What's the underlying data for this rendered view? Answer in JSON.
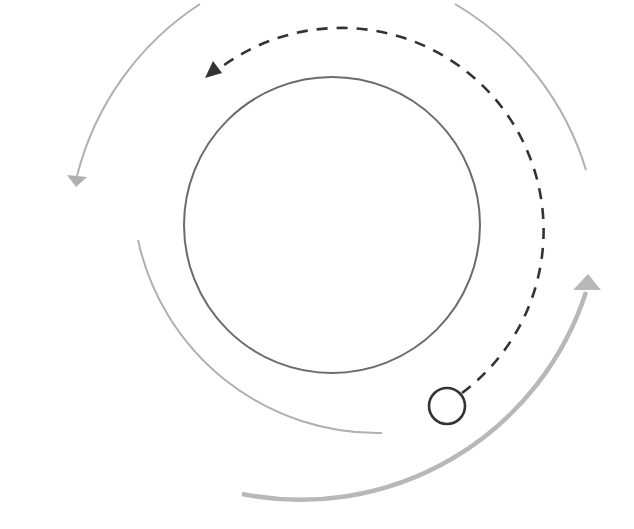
{
  "diagram": {
    "type": "cycle-arcs",
    "canvas": {
      "width": 634,
      "height": 529,
      "background": "#ffffff"
    },
    "colors": {
      "inner_circle": "#6b6b6b",
      "dashed_path": "#333333",
      "light_arc": "#b0b0b0",
      "thick_arc": "#b8b8b8",
      "marker_circle": "#333333"
    },
    "elements": [
      {
        "id": "inner-circle",
        "kind": "circle",
        "cx": 332,
        "cy": 225,
        "r": 148
      },
      {
        "id": "dashed-arc",
        "kind": "dashed-arrow-arc",
        "direction": "counter-clockwise"
      },
      {
        "id": "marker-circle",
        "kind": "circle",
        "cx": 447,
        "cy": 406,
        "r": 18
      },
      {
        "id": "outer-left-arc",
        "kind": "arrow-arc",
        "direction": "counter-clockwise"
      },
      {
        "id": "outer-right-arc",
        "kind": "arc"
      },
      {
        "id": "lower-left-arc",
        "kind": "arc"
      },
      {
        "id": "bottom-thick-arc",
        "kind": "arrow-arc",
        "direction": "counter-clockwise"
      }
    ]
  }
}
